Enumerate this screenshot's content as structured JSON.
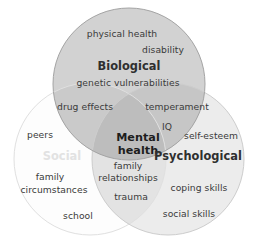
{
  "diagram": {
    "type": "venn-3-circle",
    "title_visible": false,
    "background_color": "#ffffff",
    "circles": [
      {
        "id": "biological",
        "label": "Biological",
        "fill_color": "#cfcfcf",
        "stroke_color": "#9a9a9a",
        "label_color": "#2f2f2f",
        "cx": 129,
        "cy": 84,
        "r": 76,
        "items": [
          "physical health",
          "disability",
          "genetic vulnerabilities"
        ]
      },
      {
        "id": "social",
        "label": "Social",
        "fill_color": "#fdfdfd",
        "stroke_color": "#dcdcdc",
        "label_color": "#e2e2e2",
        "cx": 90,
        "cy": 159,
        "r": 76,
        "items": [
          "peers",
          "family circumstances",
          "school"
        ]
      },
      {
        "id": "psychological",
        "label": "Psychological",
        "fill_color": "#ededed",
        "stroke_color": "#cfcfcf",
        "label_color": "#2f2f2f",
        "cx": 168,
        "cy": 159,
        "r": 76,
        "items": [
          "self-esteem",
          "IQ",
          "coping skills",
          "social skills"
        ]
      }
    ],
    "overlaps": [
      {
        "id": "biological-social",
        "sets": [
          "biological",
          "social"
        ],
        "items": [
          "drug effects"
        ]
      },
      {
        "id": "biological-psychological",
        "sets": [
          "biological",
          "psychological"
        ],
        "items": [
          "temperament"
        ]
      },
      {
        "id": "social-psychological",
        "sets": [
          "social",
          "psychological"
        ],
        "items": [
          "family relationships",
          "trauma"
        ]
      },
      {
        "id": "center",
        "sets": [
          "biological",
          "social",
          "psychological"
        ],
        "items": [
          "Mental health"
        ]
      }
    ],
    "labels": {
      "biological_title": "Biological",
      "social_title": "Social",
      "psychological_title": "Psychological",
      "center_line1": "Mental",
      "center_line2": "health",
      "physical_health": "physical health",
      "disability": "disability",
      "genetic_vulnerabilities": "genetic vulnerabilities",
      "drug_effects": "drug effects",
      "temperament": "temperament",
      "iq": "IQ",
      "self_esteem": "self-esteem",
      "coping_skills": "coping skills",
      "social_skills": "social skills",
      "peers": "peers",
      "family_circumstances_line1": "family",
      "family_circumstances_line2": "circumstances",
      "school": "school",
      "family_relationships_line1": "family",
      "family_relationships_line2": "relationships",
      "trauma": "trauma"
    }
  }
}
